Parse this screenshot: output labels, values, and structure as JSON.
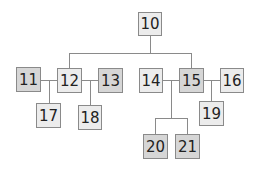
{
  "diagram": {
    "type": "tree",
    "colors": {
      "light_node": "#ececec",
      "dark_node": "#d6d6d6",
      "line": "#8a8a8a"
    },
    "nodes": [
      {
        "id": "10",
        "label": "10",
        "shade": "light"
      },
      {
        "id": "11",
        "label": "11",
        "shade": "dark"
      },
      {
        "id": "12",
        "label": "12",
        "shade": "light"
      },
      {
        "id": "13",
        "label": "13",
        "shade": "dark"
      },
      {
        "id": "14",
        "label": "14",
        "shade": "light"
      },
      {
        "id": "15",
        "label": "15",
        "shade": "dark"
      },
      {
        "id": "16",
        "label": "16",
        "shade": "light"
      },
      {
        "id": "17",
        "label": "17",
        "shade": "light"
      },
      {
        "id": "18",
        "label": "18",
        "shade": "light"
      },
      {
        "id": "19",
        "label": "19",
        "shade": "light"
      },
      {
        "id": "20",
        "label": "20",
        "shade": "dark"
      },
      {
        "id": "21",
        "label": "21",
        "shade": "dark"
      }
    ],
    "edges": [
      [
        "10",
        "12"
      ],
      [
        "10",
        "15"
      ],
      [
        "11",
        "12"
      ],
      [
        "12",
        "13"
      ],
      [
        "11-12",
        "17"
      ],
      [
        "12-13",
        "18"
      ],
      [
        "14",
        "15"
      ],
      [
        "15",
        "16"
      ],
      [
        "14-15",
        "20"
      ],
      [
        "14-15",
        "21"
      ],
      [
        "15-16",
        "19"
      ]
    ]
  }
}
